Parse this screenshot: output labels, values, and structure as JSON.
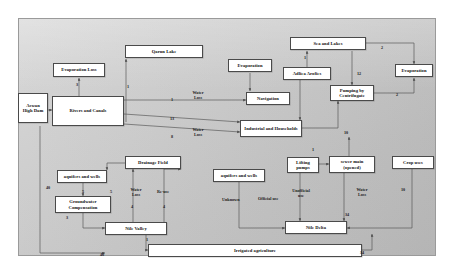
{
  "diagram": {
    "frame": {
      "border_color": "#9a9a9a",
      "background": "#cccccc"
    },
    "node_style": {
      "fill": "#ffffff",
      "stroke": "#4a4a4a",
      "text_color": "#111111"
    },
    "edge_color": "#555555",
    "nodes": [
      {
        "id": "aswan-high-dam",
        "label": "Aswan High Dam",
        "x": 18,
        "y": 93,
        "w": 30,
        "h": 30
      },
      {
        "id": "evaporation-loss",
        "label": "Evaporation Loss",
        "x": 53,
        "y": 63,
        "w": 52,
        "h": 14
      },
      {
        "id": "qarun-lake",
        "label": "Qarun Lake",
        "x": 125,
        "y": 45,
        "w": 78,
        "h": 13
      },
      {
        "id": "evaporation-mid",
        "label": "Evaporation",
        "x": 228,
        "y": 59,
        "w": 44,
        "h": 13
      },
      {
        "id": "sea-and-lakes",
        "label": "Sea and Lakes",
        "x": 290,
        "y": 37,
        "w": 76,
        "h": 13
      },
      {
        "id": "adliea-arofies",
        "label": "Adliea Arofies",
        "x": 283,
        "y": 67,
        "w": 48,
        "h": 13
      },
      {
        "id": "evaporation-right",
        "label": "Evaporation",
        "x": 395,
        "y": 64,
        "w": 38,
        "h": 13
      },
      {
        "id": "rivers-and-canals",
        "label": "Rivers and Canals",
        "x": 52,
        "y": 96,
        "w": 72,
        "h": 30
      },
      {
        "id": "navigation",
        "label": "Navigation",
        "x": 246,
        "y": 92,
        "w": 44,
        "h": 13
      },
      {
        "id": "pumping-by-coastal",
        "label": "Pumping by Centrifugate",
        "x": 330,
        "y": 85,
        "w": 44,
        "h": 16
      },
      {
        "id": "industrial-households",
        "label": "Industrial and Households",
        "x": 240,
        "y": 120,
        "w": 62,
        "h": 17
      },
      {
        "id": "drainage-field",
        "label": "Drainage Field",
        "x": 125,
        "y": 156,
        "w": 56,
        "h": 13
      },
      {
        "id": "aquifers-wells-left",
        "label": "aquifers and wells",
        "x": 57,
        "y": 170,
        "w": 50,
        "h": 13
      },
      {
        "id": "aquifers-wells-right",
        "label": "aquifers and wells",
        "x": 213,
        "y": 169,
        "w": 52,
        "h": 13
      },
      {
        "id": "lifting-pumps",
        "label": "Lifting pumps",
        "x": 287,
        "y": 157,
        "w": 32,
        "h": 16
      },
      {
        "id": "sewer-main-opened",
        "label": "sewer main (opened)",
        "x": 329,
        "y": 156,
        "w": 46,
        "h": 17
      },
      {
        "id": "crop-uses",
        "label": "Crop uses",
        "x": 392,
        "y": 156,
        "w": 42,
        "h": 13
      },
      {
        "id": "groundwater-comp",
        "label": "Groundwater Compensation",
        "x": 55,
        "y": 196,
        "w": 56,
        "h": 17
      },
      {
        "id": "nile-valley",
        "label": "Nile Valley",
        "x": 105,
        "y": 222,
        "w": 62,
        "h": 13
      },
      {
        "id": "nile-delta",
        "label": "Nile Delta",
        "x": 285,
        "y": 221,
        "w": 62,
        "h": 13
      },
      {
        "id": "irrigated-agriculture",
        "label": "Irrigated agriculture",
        "x": 148,
        "y": 244,
        "w": 214,
        "h": 13
      }
    ],
    "edge_labels": [
      {
        "id": "lbl-3",
        "text": "3",
        "x": 76,
        "y": 83
      },
      {
        "id": "lbl-1-qarun",
        "text": "1",
        "x": 127,
        "y": 85
      },
      {
        "id": "lbl-1-seaandlakes",
        "text": "1",
        "x": 304,
        "y": 56
      },
      {
        "id": "lbl-2-top",
        "text": "2",
        "x": 381,
        "y": 46
      },
      {
        "id": "lbl-2-right",
        "text": "2",
        "x": 396,
        "y": 93
      },
      {
        "id": "lbl-12",
        "text": "12",
        "x": 357,
        "y": 72
      },
      {
        "id": "lbl-water-loss-1",
        "text": "Water Loss",
        "x": 188,
        "y": 91,
        "multi": true
      },
      {
        "id": "lbl-1-wl1",
        "text": "1",
        "x": 171,
        "y": 98
      },
      {
        "id": "lbl-13",
        "text": "13",
        "x": 170,
        "y": 117
      },
      {
        "id": "lbl-8",
        "text": "8",
        "x": 171,
        "y": 135
      },
      {
        "id": "lbl-water-loss-2",
        "text": "Water Loss",
        "x": 188,
        "y": 128,
        "multi": true
      },
      {
        "id": "lbl-10",
        "text": "10",
        "x": 344,
        "y": 131
      },
      {
        "id": "lbl-1-sewer",
        "text": "1",
        "x": 312,
        "y": 148
      },
      {
        "id": "lbl-40-left",
        "text": "40",
        "x": 46,
        "y": 186
      },
      {
        "id": "lbl-5-aquifer",
        "text": "5",
        "x": 82,
        "y": 190
      },
      {
        "id": "lbl-5-aquifer2",
        "text": "5",
        "x": 110,
        "y": 190
      },
      {
        "id": "lbl-water-loss-3",
        "text": "Water Loss",
        "x": 126,
        "y": 188,
        "multi": true
      },
      {
        "id": "lbl-4-wl3",
        "text": "4",
        "x": 131,
        "y": 205
      },
      {
        "id": "lbl-reuse",
        "text": "Re-use",
        "x": 157,
        "y": 190
      },
      {
        "id": "lbl-4-reuse",
        "text": "4",
        "x": 163,
        "y": 205
      },
      {
        "id": "lbl-unknown",
        "text": "Unknown",
        "x": 222,
        "y": 198
      },
      {
        "id": "lbl-official-use",
        "text": "Official use",
        "x": 258,
        "y": 197
      },
      {
        "id": "lbl-unofficial-use",
        "text": "Unofficial use",
        "x": 291,
        "y": 189,
        "multi": true
      },
      {
        "id": "lbl-water-loss-4",
        "text": "Water Loss",
        "x": 352,
        "y": 188,
        "multi": true
      },
      {
        "id": "lbl-34",
        "text": "34",
        "x": 345,
        "y": 213
      },
      {
        "id": "lbl-10-crop",
        "text": "10",
        "x": 401,
        "y": 188
      },
      {
        "id": "lbl-3-gw",
        "text": "3",
        "x": 66,
        "y": 216
      },
      {
        "id": "lbl-1-nv",
        "text": "1",
        "x": 146,
        "y": 238
      },
      {
        "id": "lbl-40-bottom",
        "text": "40",
        "x": 100,
        "y": 253
      },
      {
        "id": "lbl-34-bottom",
        "text": "34",
        "x": 360,
        "y": 251
      }
    ]
  }
}
